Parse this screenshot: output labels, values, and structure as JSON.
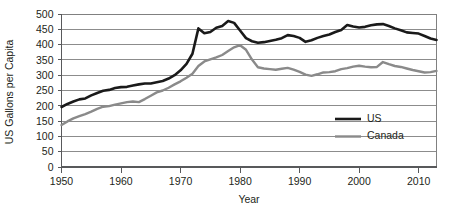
{
  "chart_data": {
    "type": "line",
    "title": "",
    "xlabel": "Year",
    "ylabel": "US Gallons per Capita",
    "xlim": [
      1950,
      2013
    ],
    "ylim": [
      0,
      500
    ],
    "grid": true,
    "legend_position": "inside-right",
    "x_ticks": [
      1950,
      1960,
      1970,
      1980,
      1990,
      2000,
      2010
    ],
    "x_tick_labels": [
      "1950",
      "1960",
      "1970",
      "1980",
      "1990",
      "2000",
      "2010"
    ],
    "y_ticks": [
      0,
      50,
      100,
      150,
      200,
      250,
      300,
      350,
      400,
      450,
      500
    ],
    "y_tick_labels": [
      "0",
      "50",
      "100",
      "150",
      "200",
      "250",
      "300",
      "350",
      "400",
      "450",
      "500"
    ],
    "x": [
      1950,
      1951,
      1952,
      1953,
      1954,
      1955,
      1956,
      1957,
      1958,
      1959,
      1960,
      1961,
      1962,
      1963,
      1964,
      1965,
      1966,
      1967,
      1968,
      1969,
      1970,
      1971,
      1972,
      1973,
      1974,
      1975,
      1976,
      1977,
      1978,
      1979,
      1980,
      1981,
      1982,
      1983,
      1984,
      1985,
      1986,
      1987,
      1988,
      1989,
      1990,
      1991,
      1992,
      1993,
      1994,
      1995,
      1996,
      1997,
      1998,
      1999,
      2000,
      2001,
      2002,
      2003,
      2004,
      2005,
      2006,
      2007,
      2008,
      2009,
      2010,
      2011,
      2012,
      2013
    ],
    "series": [
      {
        "name": "US",
        "color": "#1a1a1a",
        "values": [
          196,
          206,
          214,
          221,
          224,
          234,
          242,
          249,
          252,
          258,
          261,
          262,
          266,
          270,
          273,
          273,
          277,
          281,
          289,
          300,
          316,
          337,
          370,
          453,
          437,
          441,
          455,
          461,
          477,
          471,
          446,
          421,
          411,
          406,
          408,
          412,
          416,
          421,
          431,
          428,
          422,
          409,
          414,
          422,
          428,
          433,
          441,
          448,
          464,
          459,
          456,
          458,
          463,
          466,
          467,
          461,
          453,
          447,
          440,
          438,
          436,
          428,
          420,
          415
        ]
      },
      {
        "name": "Canada",
        "color": "#8a8a8a",
        "values": [
          137,
          149,
          159,
          166,
          173,
          181,
          190,
          197,
          199,
          204,
          208,
          212,
          214,
          212,
          222,
          233,
          244,
          250,
          259,
          270,
          280,
          292,
          305,
          330,
          345,
          352,
          358,
          366,
          379,
          391,
          398,
          383,
          351,
          326,
          322,
          320,
          318,
          321,
          324,
          318,
          311,
          302,
          298,
          303,
          309,
          310,
          313,
          320,
          323,
          328,
          331,
          328,
          326,
          327,
          343,
          336,
          330,
          327,
          322,
          317,
          313,
          309,
          310,
          314
        ]
      }
    ]
  },
  "legend": {
    "items": [
      {
        "label": "US",
        "color": "#1a1a1a"
      },
      {
        "label": "Canada",
        "color": "#8a8a8a"
      }
    ]
  },
  "axes": {
    "y_title": "US Gallons per Capita",
    "x_title": "Year"
  }
}
